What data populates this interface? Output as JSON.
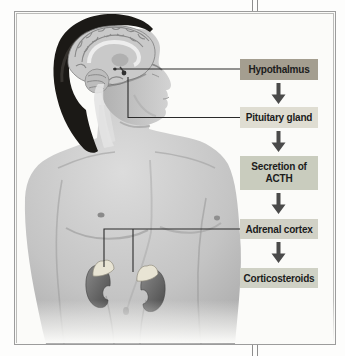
{
  "figure": {
    "flowchart": {
      "boxes": [
        {
          "label": "Hypothalmus",
          "bg": "#a49e90",
          "highlighted": true
        },
        {
          "label": "Pituitary gland",
          "bg": "#dfddd2",
          "highlighted": false
        },
        {
          "label": "Secretion of ACTH",
          "bg": "#c9ccbe",
          "highlighted": false
        },
        {
          "label": "Adrenal cortex",
          "bg": "#d1d1c6",
          "highlighted": false
        },
        {
          "label": "Corticosteroids",
          "bg": "#cfd1c5",
          "highlighted": false
        }
      ],
      "arrow_color": "#4a4a4a",
      "connector_color": "#2b2b2b",
      "text_color": "#1c1c1c"
    },
    "illustration": {
      "name": "male-figure-sagittal-head-with-kidneys",
      "parts": [
        "brain-sagittal-section",
        "pituitary-gland",
        "face-profile",
        "torso",
        "left-kidney-with-adrenal-gland",
        "right-kidney-with-adrenal-gland"
      ]
    },
    "frame": {
      "outer_line": "#9c9c9c",
      "inner_line": "#bcbcba",
      "background": "#fbfbf9"
    },
    "column_rule_color": "#8e8e8e",
    "page_background": "#fdfdfc"
  }
}
